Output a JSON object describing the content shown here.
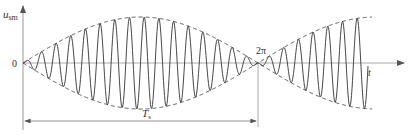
{
  "figure": {
    "labels": {
      "y_axis": "u",
      "y_axis_sub": "sm",
      "x_axis": "t",
      "origin": "0",
      "phase_mark": "2π",
      "period": "T",
      "period_sub": "s"
    },
    "colors": {
      "axis": "#999999",
      "signal": "#333333",
      "envelope": "#444444",
      "text": "#333333",
      "background": "#ffffff"
    },
    "geometry": {
      "origin_x": 23,
      "axis_y": 63,
      "period_end_x": 258,
      "envelope_peak_amplitude_px": 46,
      "carrier_cycles_in_period": 16
    }
  }
}
